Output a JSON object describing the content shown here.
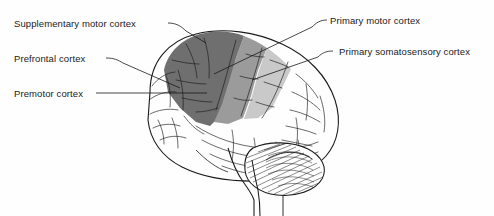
{
  "figure": {
    "background_color": "#fefefe",
    "outline_color": "#1a1a1a",
    "view": "left lateral",
    "structures": [
      {
        "name": "cerebrum",
        "fill": "#ffffff"
      },
      {
        "name": "cerebellum",
        "fill": "#ffffff",
        "texture": "hatched-folia"
      },
      {
        "name": "brainstem",
        "fill": "#ffffff"
      }
    ]
  },
  "labels": {
    "supplementary_motor": "Supplementary motor cortex",
    "prefrontal": "Prefrontal cortex",
    "premotor": "Premotor cortex",
    "primary_motor": "Primary motor cortex",
    "primary_somatosensory": "Primary somatosensory cortex"
  },
  "regions": [
    {
      "key": "premotor",
      "label": "Premotor cortex",
      "fill": "#6f6f6f",
      "tone": "dark-gray"
    },
    {
      "key": "primary_motor",
      "label": "Primary motor cortex",
      "fill": "#9b9b9b",
      "tone": "medium-gray"
    },
    {
      "key": "primary_somatosensory",
      "label": "Primary somatosensory cortex",
      "fill": "#c9c9c9",
      "tone": "light-gray"
    },
    {
      "key": "prefrontal",
      "label": "Prefrontal cortex",
      "fill": "#ffffff",
      "tone": "unshaded"
    },
    {
      "key": "supplementary_motor",
      "label": "Supplementary motor cortex",
      "fill": "#6f6f6f",
      "tone": "dark-gray"
    }
  ],
  "leader_lines": [
    {
      "for": "supplementary_motor",
      "from": [
        168,
        23
      ],
      "to": [
        206,
        43
      ]
    },
    {
      "for": "prefrontal",
      "from": [
        106,
        58
      ],
      "to": [
        180,
        88
      ]
    },
    {
      "for": "premotor",
      "from": [
        96,
        93
      ],
      "to": [
        207,
        93
      ]
    },
    {
      "for": "primary_motor",
      "from": [
        327,
        20
      ],
      "to": [
        214,
        74
      ]
    },
    {
      "for": "primary_somatosensory",
      "from": [
        333,
        51
      ],
      "to": [
        252,
        80
      ]
    }
  ],
  "colors": {
    "dark_gray": "#6f6f6f",
    "medium_gray": "#9b9b9b",
    "light_gray": "#c9c9c9",
    "ink": "#1a1a1a",
    "background": "#fefefe"
  }
}
